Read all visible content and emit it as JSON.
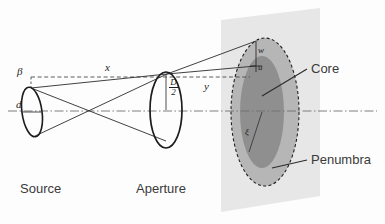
{
  "figure": {
    "type": "optics-ray-diagram",
    "width": 385,
    "height": 224,
    "background_color": "#fdfdfd"
  },
  "colors": {
    "screen_plane": "#e6e6e6",
    "penumbra_fill": "#b4b4b4",
    "core_fill": "#8e8e8e",
    "line": "#2b2b2b",
    "axis": "#6f6f6f",
    "text": "#3a3a3a"
  },
  "objects": {
    "source": {
      "label": "Source",
      "symbol_angle": "β",
      "symbol_diameter": "d"
    },
    "aperture": {
      "label": "Aperture",
      "symbol_radius_numerator": "D",
      "symbol_radius_denominator": "2"
    },
    "screen": {
      "core_label": "Core",
      "penumbra_label": "Penumbra",
      "core_radius_symbol": "ξ",
      "penumbra_edge_symbol": "w",
      "core_edge_symbol": "u"
    }
  },
  "distances": {
    "source_to_aperture": "x",
    "aperture_to_screen": "y"
  }
}
